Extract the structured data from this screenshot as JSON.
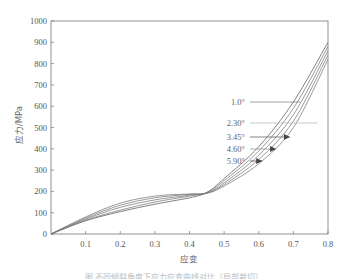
{
  "chart_data": {
    "type": "line",
    "title": "",
    "xlabel": "应变",
    "ylabel": "应力/MPa",
    "xlim": [
      0,
      0.8
    ],
    "ylim": [
      0,
      1000
    ],
    "grid": false,
    "legend_position": "inline-annotations (center-right, arrows pointing to curves)",
    "x_ticks": [
      "0.1",
      "0.2",
      "0.3",
      "0.4",
      "0.5",
      "0.6",
      "0.7",
      "0.8"
    ],
    "y_ticks": [
      "0",
      "100",
      "200",
      "300",
      "400",
      "500",
      "600",
      "700",
      "800",
      "900",
      "1000"
    ],
    "x": [
      0.0,
      0.1,
      0.2,
      0.3,
      0.4,
      0.45,
      0.5,
      0.6,
      0.7,
      0.8
    ],
    "series": [
      {
        "name": "1.0°",
        "values": [
          0,
          62,
          105,
          140,
          170,
          195,
          260,
          410,
          620,
          900
        ]
      },
      {
        "name": "2.30°",
        "values": [
          0,
          65,
          112,
          150,
          178,
          195,
          250,
          390,
          590,
          880
        ]
      },
      {
        "name": "3.45°",
        "values": [
          0,
          70,
          125,
          160,
          182,
          193,
          240,
          370,
          560,
          860
        ]
      },
      {
        "name": "4.60°",
        "values": [
          0,
          75,
          135,
          170,
          186,
          192,
          232,
          350,
          530,
          840
        ]
      },
      {
        "name": "5.90°",
        "values": [
          0,
          80,
          145,
          178,
          188,
          191,
          225,
          330,
          500,
          820
        ]
      }
    ],
    "annotations": [
      {
        "text": "1.0°",
        "points_to_x": 0.72
      },
      {
        "text": "2.30°",
        "points_to_x": 0.77
      },
      {
        "text": "3.45°",
        "points_to_x": 0.69
      },
      {
        "text": "4.60°",
        "points_to_x": 0.65
      },
      {
        "text": "5.90°",
        "points_to_x": 0.61
      }
    ]
  },
  "labels": {
    "xlabel": "应变",
    "ylabel": "应力/MPa",
    "caption": "图 不同倾斜角度下应力应变曲线对比（局部裁切）"
  }
}
